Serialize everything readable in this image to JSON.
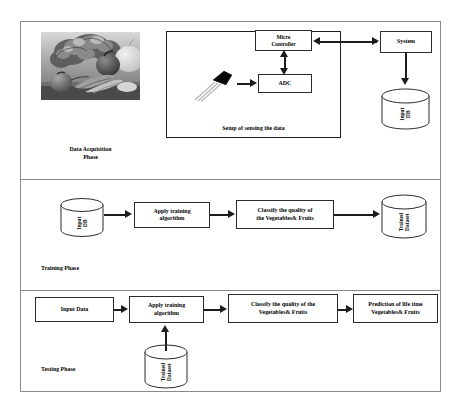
{
  "diagram": {
    "phases": [
      {
        "id": "data-acquisition",
        "label": "Data Acquisition\nPhase",
        "photo_alt": "Assorted fresh vegetables — lettuce, tomato, carrots, onion",
        "setup_caption": "Setup of sensing the data",
        "nodes": [
          {
            "id": "micro-controller",
            "label": "Micro\nController",
            "type": "box"
          },
          {
            "id": "adc",
            "label": "ADC",
            "type": "box"
          },
          {
            "id": "system",
            "label": "System",
            "type": "box"
          },
          {
            "id": "input-db",
            "label": "Input\nDB",
            "type": "cylinder"
          },
          {
            "id": "sensor",
            "label": "",
            "type": "sensor-icon"
          }
        ],
        "edges": [
          {
            "from": "sensor",
            "to": "adc",
            "direction": "right"
          },
          {
            "from": "adc",
            "to": "micro-controller",
            "direction": "bidirectional-vertical"
          },
          {
            "from": "micro-controller",
            "to": "system",
            "direction": "bidirectional-horizontal"
          },
          {
            "from": "system",
            "to": "input-db",
            "direction": "down"
          }
        ]
      },
      {
        "id": "training",
        "label": "Training Phase",
        "nodes": [
          {
            "id": "training-input-db",
            "label": "Input\nDB",
            "type": "cylinder"
          },
          {
            "id": "training-apply-algorithm",
            "label": "Apply training\nalgorithm",
            "type": "box"
          },
          {
            "id": "training-classify",
            "label": "Classify the quality of\nthe Vegetables& Fruits",
            "type": "box"
          },
          {
            "id": "training-trained-dataset",
            "label": "Trained\nDataset",
            "type": "cylinder"
          }
        ],
        "edges": [
          {
            "from": "training-input-db",
            "to": "training-apply-algorithm",
            "direction": "right"
          },
          {
            "from": "training-apply-algorithm",
            "to": "training-classify",
            "direction": "right"
          },
          {
            "from": "training-classify",
            "to": "training-trained-dataset",
            "direction": "right"
          }
        ]
      },
      {
        "id": "testing",
        "label": "Testing Phase",
        "nodes": [
          {
            "id": "testing-input-data",
            "label": "Input Data",
            "type": "box"
          },
          {
            "id": "testing-apply-algorithm",
            "label": "Apply training\nalgorithm",
            "type": "box"
          },
          {
            "id": "testing-classify",
            "label": "Classify the quality of the\nVegetables& Fruits",
            "type": "box"
          },
          {
            "id": "testing-prediction",
            "label": "Prediction of life time\nVegetables& Fruits",
            "type": "box"
          },
          {
            "id": "testing-trained-dataset",
            "label": "Trained\nDataset",
            "type": "cylinder"
          }
        ],
        "edges": [
          {
            "from": "testing-input-data",
            "to": "testing-apply-algorithm",
            "direction": "right"
          },
          {
            "from": "testing-apply-algorithm",
            "to": "testing-classify",
            "direction": "right"
          },
          {
            "from": "testing-classify",
            "to": "testing-prediction",
            "direction": "right"
          },
          {
            "from": "testing-trained-dataset",
            "to": "testing-apply-algorithm",
            "direction": "up"
          }
        ]
      }
    ]
  },
  "colors": {
    "frame": "#8a8a8a",
    "node_border": "#2b2b2b",
    "arrow": "#1d1d1d",
    "background": "#ffffff",
    "text": "#000000"
  }
}
